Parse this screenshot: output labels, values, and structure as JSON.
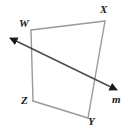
{
  "figure": {
    "type": "geometry-diagram",
    "background_color": "#ffffff",
    "shape": {
      "name": "quadrilateral-WXYZ",
      "stroke_color": "#9a9a9a",
      "stroke_width": 1.4,
      "fill": "none",
      "vertices": [
        {
          "id": "W",
          "label": "W",
          "x": 31,
          "y": 30
        },
        {
          "id": "X",
          "label": "X",
          "x": 105,
          "y": 21
        },
        {
          "id": "Y",
          "label": "Y",
          "x": 88,
          "y": 118
        },
        {
          "id": "Z",
          "label": "Z",
          "x": 33,
          "y": 101
        }
      ],
      "edges": [
        {
          "from": "W",
          "to": "X"
        },
        {
          "from": "X",
          "to": "Y"
        },
        {
          "from": "Y",
          "to": "Z"
        },
        {
          "from": "Z",
          "to": "W"
        }
      ]
    },
    "transversal": {
      "name": "line-m",
      "label": "m",
      "stroke_color": "#4a4a4a",
      "stroke_width": 1.4,
      "start": {
        "x": 10,
        "y": 38
      },
      "end": {
        "x": 117,
        "y": 90
      },
      "arrowheads": [
        "start",
        "end"
      ],
      "arrow_color": "#1a1a1a",
      "crosses_edges": [
        "ZW",
        "XY"
      ]
    },
    "labels": {
      "W": "W",
      "X": "X",
      "Y": "Y",
      "Z": "Z",
      "m": "m"
    }
  }
}
